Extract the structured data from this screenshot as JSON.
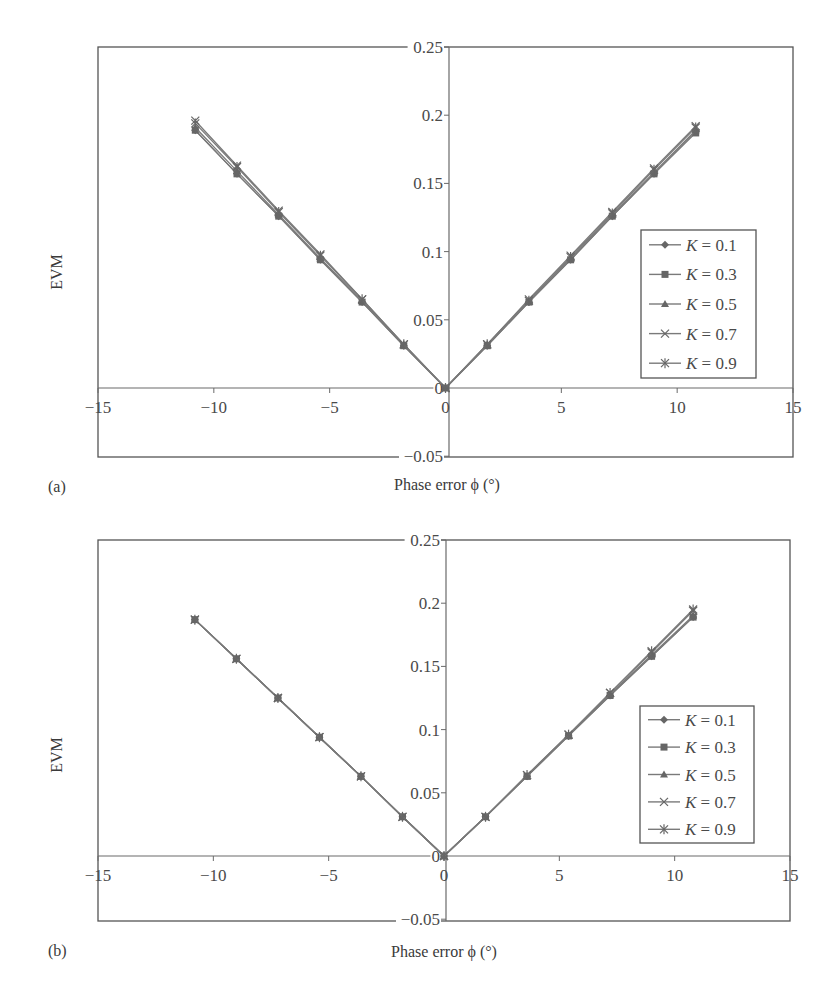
{
  "colors": {
    "axis": "#6a6a6a",
    "frame": "#555555",
    "series": "#7a7a7a",
    "marker": "#666666",
    "text": "#4a4a4a"
  },
  "chart_data": [
    {
      "panel_label": "(a)",
      "type": "line",
      "title": "",
      "xlabel": "Phase error ϕ (°)",
      "ylabel": "EVM",
      "xlim": [
        -15,
        15
      ],
      "ylim": [
        -0.05,
        0.25
      ],
      "xticks": [
        -15,
        -10,
        -5,
        0,
        5,
        10,
        15
      ],
      "xtick_labels": [
        "−15",
        "−10",
        "−5",
        "0",
        "5",
        "10",
        "15"
      ],
      "yticks": [
        -0.05,
        0,
        0.05,
        0.1,
        0.15,
        0.2,
        0.25
      ],
      "ytick_labels": [
        "−0.05",
        "0",
        "0.05",
        "0.1",
        "0.15",
        "0.2",
        "0.25"
      ],
      "grid": false,
      "legend_position": "right, inside",
      "x": [
        -10.8,
        -9,
        -7.2,
        -5.4,
        -3.6,
        -1.8,
        0,
        1.8,
        3.6,
        5.4,
        7.2,
        9,
        10.8
      ],
      "series": [
        {
          "name": "K = 0.1",
          "marker": "diamond",
          "values": [
            0.189,
            0.157,
            0.126,
            0.094,
            0.063,
            0.031,
            0,
            0.031,
            0.063,
            0.094,
            0.126,
            0.157,
            0.188
          ]
        },
        {
          "name": "K = 0.3",
          "marker": "square",
          "values": [
            0.189,
            0.157,
            0.126,
            0.094,
            0.063,
            0.031,
            0,
            0.031,
            0.063,
            0.094,
            0.126,
            0.157,
            0.187
          ]
        },
        {
          "name": "K = 0.5",
          "marker": "triangle",
          "values": [
            0.191,
            0.159,
            0.127,
            0.095,
            0.064,
            0.032,
            0,
            0.032,
            0.064,
            0.095,
            0.127,
            0.158,
            0.189
          ]
        },
        {
          "name": "K = 0.7",
          "marker": "cross",
          "values": [
            0.196,
            0.163,
            0.13,
            0.098,
            0.065,
            0.032,
            0,
            0.032,
            0.065,
            0.097,
            0.129,
            0.161,
            0.192
          ]
        },
        {
          "name": "K = 0.9",
          "marker": "star",
          "values": [
            0.194,
            0.162,
            0.129,
            0.097,
            0.065,
            0.032,
            0,
            0.032,
            0.064,
            0.096,
            0.128,
            0.16,
            0.191
          ]
        }
      ]
    },
    {
      "panel_label": "(b)",
      "type": "line",
      "title": "",
      "xlabel": "Phase error ϕ (°)",
      "ylabel": "EVM",
      "xlim": [
        -15,
        15
      ],
      "ylim": [
        -0.05,
        0.25
      ],
      "xticks": [
        -15,
        -10,
        -5,
        0,
        5,
        10,
        15
      ],
      "xtick_labels": [
        "−15",
        "−10",
        "−5",
        "0",
        "5",
        "10",
        "15"
      ],
      "yticks": [
        -0.05,
        0,
        0.05,
        0.1,
        0.15,
        0.2,
        0.25
      ],
      "ytick_labels": [
        "−0.05",
        "0",
        "0.05",
        "0.1",
        "0.15",
        "0.2",
        "0.25"
      ],
      "grid": false,
      "legend_position": "right, inside",
      "x": [
        -10.8,
        -9,
        -7.2,
        -5.4,
        -3.6,
        -1.8,
        0,
        1.8,
        3.6,
        5.4,
        7.2,
        9,
        10.8
      ],
      "series": [
        {
          "name": "K = 0.1",
          "marker": "diamond",
          "values": [
            0.187,
            0.156,
            0.125,
            0.094,
            0.063,
            0.031,
            0,
            0.031,
            0.063,
            0.095,
            0.127,
            0.158,
            0.189
          ]
        },
        {
          "name": "K = 0.3",
          "marker": "square",
          "values": [
            0.187,
            0.156,
            0.125,
            0.094,
            0.063,
            0.031,
            0,
            0.031,
            0.063,
            0.095,
            0.127,
            0.158,
            0.189
          ]
        },
        {
          "name": "K = 0.5",
          "marker": "triangle",
          "values": [
            0.187,
            0.156,
            0.125,
            0.094,
            0.063,
            0.031,
            0,
            0.031,
            0.063,
            0.096,
            0.128,
            0.159,
            0.19
          ]
        },
        {
          "name": "K = 0.7",
          "marker": "cross",
          "values": [
            0.187,
            0.156,
            0.125,
            0.094,
            0.063,
            0.031,
            0,
            0.031,
            0.064,
            0.096,
            0.129,
            0.161,
            0.194
          ]
        },
        {
          "name": "K = 0.9",
          "marker": "star",
          "values": [
            0.187,
            0.156,
            0.125,
            0.094,
            0.063,
            0.031,
            0,
            0.031,
            0.064,
            0.096,
            0.129,
            0.162,
            0.195
          ]
        }
      ]
    }
  ],
  "layout": [
    {
      "frame": {
        "left": 98,
        "right": 793,
        "top": 47,
        "bottom": 457
      },
      "x_to_px": {
        "x0": 98,
        "x1": 793
      },
      "y_to_px": {
        "v_top": 0.25,
        "px_top": 47,
        "v_zero": 0,
        "px_zero": 388
      },
      "yaxis_x": 449,
      "legend": {
        "x": 641,
        "y": 230,
        "w": 115,
        "h": 148
      },
      "ylabel_pos": {
        "x": 62,
        "y": 272
      },
      "xlabel_pos": {
        "x": 447,
        "y": 490
      },
      "panel_label_pos": {
        "x": 48,
        "y": 492
      }
    },
    {
      "frame": {
        "left": 98,
        "right": 790,
        "top": 540,
        "bottom": 921
      },
      "x_to_px": {
        "x0": 98,
        "x1": 790
      },
      "y_to_px": {
        "v_top": 0.25,
        "px_top": 540,
        "v_zero": 0,
        "px_zero": 856
      },
      "yaxis_x": 446,
      "legend": {
        "x": 640,
        "y": 706,
        "w": 114,
        "h": 137
      },
      "ylabel_pos": {
        "x": 62,
        "y": 755
      },
      "xlabel_pos": {
        "x": 444,
        "y": 957
      },
      "panel_label_pos": {
        "x": 48,
        "y": 956
      }
    }
  ]
}
